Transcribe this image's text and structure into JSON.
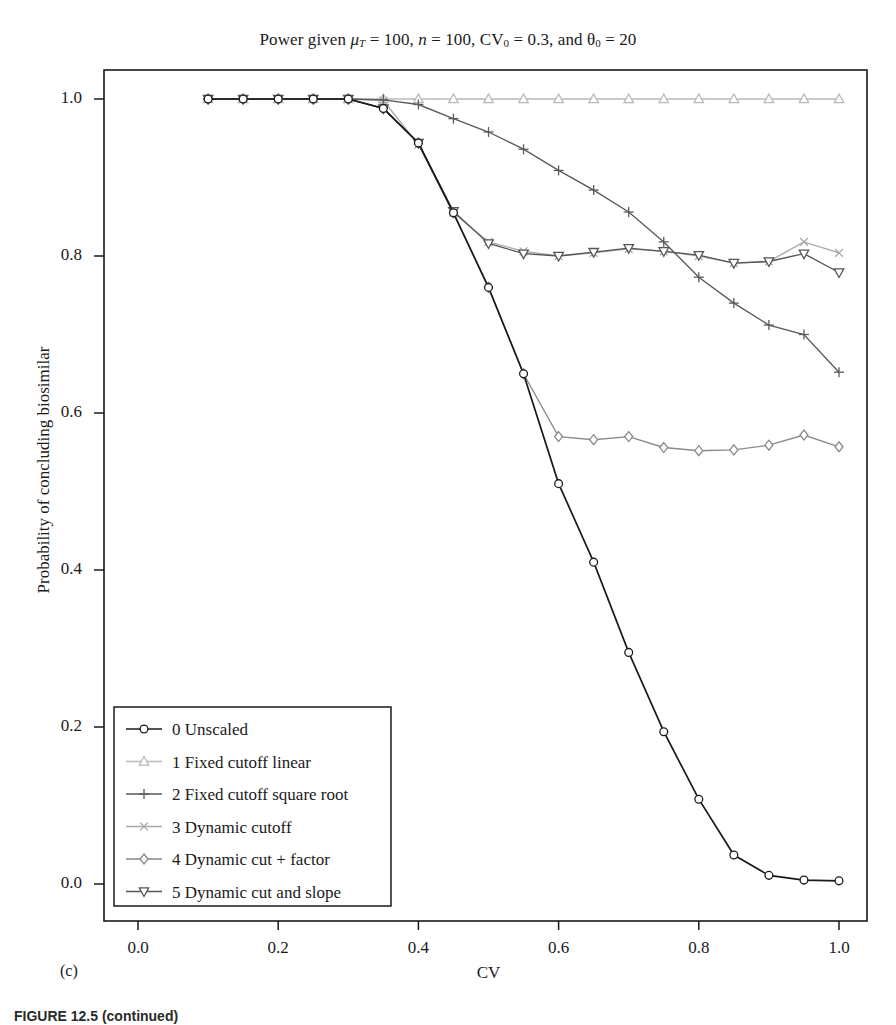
{
  "figure": {
    "panel_label": "(c)",
    "caption": "FIGURE 12.5 (continued)"
  },
  "chart_data": {
    "type": "line",
    "title_parts": {
      "lead": "Power given ",
      "mu": "μ",
      "mu_sub": "T",
      "mu_val": " = 100, ",
      "n": "n",
      "n_val": " = 100, CV",
      "cv_sub": "0",
      "cv_val": " = 0.3, and ",
      "theta": "θ",
      "theta_sub": "0",
      "theta_val": " = 20"
    },
    "xlabel": "CV",
    "ylabel": "Probability of concluding biosimilar",
    "xlim": [
      -0.02,
      1.02
    ],
    "ylim": [
      -0.02,
      1.04
    ],
    "xticks": [
      "0.0",
      "0.2",
      "0.4",
      "0.6",
      "0.8",
      "1.0"
    ],
    "xtick_values": [
      0.0,
      0.2,
      0.4,
      0.6,
      0.8,
      1.0
    ],
    "yticks": [
      "0.0",
      "0.2",
      "0.4",
      "0.6",
      "0.8",
      "1.0"
    ],
    "ytick_values": [
      0.0,
      0.2,
      0.4,
      0.6,
      0.8,
      1.0
    ],
    "grid": false,
    "legend_position": "lower left",
    "x": [
      0.1,
      0.15,
      0.2,
      0.25,
      0.3,
      0.35,
      0.4,
      0.45,
      0.5,
      0.55,
      0.6,
      0.65,
      0.7,
      0.75,
      0.8,
      0.85,
      0.9,
      0.95,
      1.0
    ],
    "series": [
      {
        "name": "0 Unscaled",
        "marker": "circle",
        "color": "#1a1a1a",
        "values": [
          1.0,
          1.0,
          1.0,
          1.0,
          1.0,
          0.988,
          0.944,
          0.855,
          0.76,
          0.65,
          0.51,
          0.41,
          0.295,
          0.194,
          0.108,
          0.037,
          0.011,
          0.005,
          0.004
        ]
      },
      {
        "name": "1 Fixed cutoff linear",
        "marker": "triangle-up",
        "color": "#b9b9b9",
        "values": [
          1.0,
          1.0,
          1.0,
          1.0,
          1.0,
          1.0,
          1.0,
          1.0,
          1.0,
          1.0,
          1.0,
          1.0,
          1.0,
          1.0,
          1.0,
          1.0,
          1.0,
          1.0,
          1.0
        ]
      },
      {
        "name": "2 Fixed cutoff square root",
        "marker": "plus",
        "color": "#5a5a5a",
        "values": [
          1.0,
          1.0,
          1.0,
          1.0,
          1.0,
          0.999,
          0.993,
          0.975,
          0.958,
          0.936,
          0.909,
          0.884,
          0.856,
          0.818,
          0.773,
          0.74,
          0.712,
          0.7,
          0.652
        ]
      },
      {
        "name": "3 Dynamic cutoff",
        "marker": "x",
        "color": "#a8a8a8",
        "values": [
          1.0,
          1.0,
          1.0,
          1.0,
          1.0,
          0.998,
          0.942,
          0.855,
          0.818,
          0.806,
          0.8,
          0.804,
          0.809,
          0.806,
          0.8,
          0.791,
          0.793,
          0.818,
          0.804
        ]
      },
      {
        "name": "4 Dynamic cut + factor",
        "marker": "diamond",
        "color": "#8a8a8a",
        "values": [
          1.0,
          1.0,
          1.0,
          1.0,
          1.0,
          0.988,
          0.944,
          0.855,
          0.76,
          0.65,
          0.57,
          0.566,
          0.57,
          0.556,
          0.552,
          0.553,
          0.559,
          0.572,
          0.557
        ]
      },
      {
        "name": "5 Dynamic cut and slope",
        "marker": "triangle-down",
        "color": "#565656",
        "values": [
          1.0,
          1.0,
          1.0,
          1.0,
          1.0,
          0.988,
          0.944,
          0.857,
          0.816,
          0.803,
          0.8,
          0.805,
          0.81,
          0.806,
          0.801,
          0.791,
          0.793,
          0.803,
          0.779
        ]
      }
    ]
  },
  "legend": {
    "items": [
      {
        "label": "0 Unscaled"
      },
      {
        "label": "1 Fixed cutoff linear"
      },
      {
        "label": "2 Fixed cutoff square root"
      },
      {
        "label": "3 Dynamic cutoff"
      },
      {
        "label": "4 Dynamic cut + factor"
      },
      {
        "label": "5 Dynamic cut and slope"
      }
    ]
  }
}
